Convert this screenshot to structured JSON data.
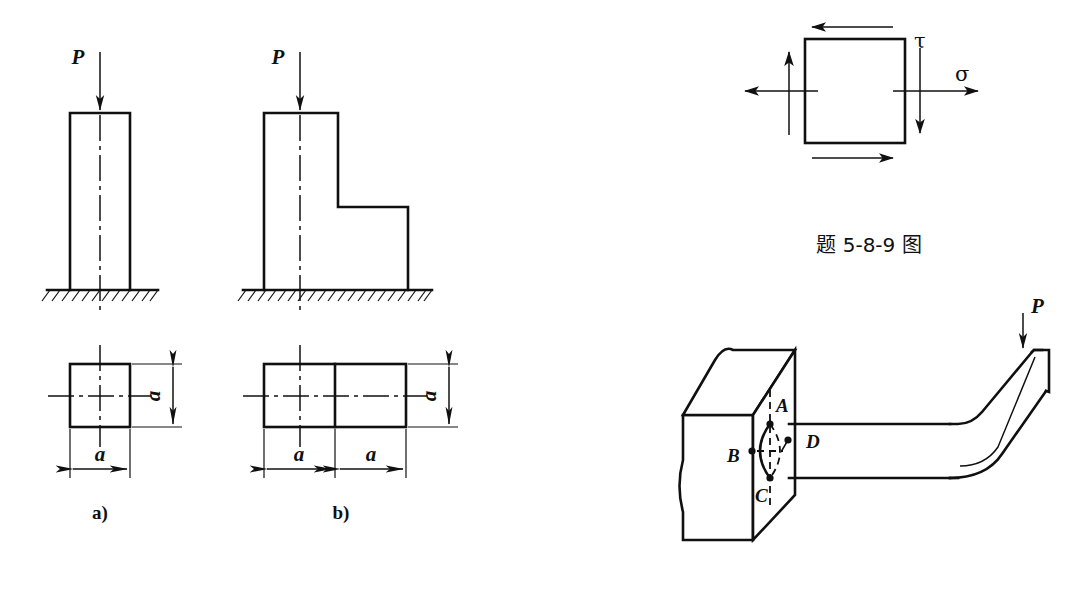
{
  "sheet": {
    "width": 1067,
    "height": 590,
    "background": "#ffffff",
    "ink": "#101010"
  },
  "figure_a": {
    "caption": "a)",
    "load_label": "P",
    "elevation": {
      "description": "square prismatic column on ground",
      "column_left": 70,
      "column_right": 130,
      "column_top": 113,
      "ground_y": 290
    },
    "plan": {
      "description": "square cross-section a by a",
      "left": 70,
      "right": 130,
      "top": 364,
      "bottom": 427,
      "width_label": "a",
      "height_label": "a"
    }
  },
  "figure_b": {
    "caption": "b)",
    "load_label": "P",
    "elevation": {
      "description": "stepped column, upper shaft over wider base",
      "column_left": 264,
      "column_right": 338,
      "column_top": 113,
      "step_y": 207,
      "base_right": 408,
      "ground_y": 290
    },
    "plan": {
      "description": "rectangular cross-section 2a by a split into two a by a squares",
      "left": 264,
      "mid": 335,
      "right": 406,
      "top": 364,
      "bottom": 427,
      "width_label_left": "a",
      "width_label_right": "a",
      "height_label": "a"
    }
  },
  "figure_stress_element": {
    "description": "plane stress element with normal stress sigma and shear stress tau",
    "square": {
      "left": 805,
      "right": 905,
      "top": 39,
      "bottom": 143
    },
    "normal_stress_label": "σ",
    "shear_stress_label": "τ",
    "arrows": [
      {
        "name": "sigma-right",
        "direction": "right"
      },
      {
        "name": "sigma-left",
        "direction": "left"
      },
      {
        "name": "tau-top",
        "direction": "left"
      },
      {
        "name": "tau-bottom",
        "direction": "right"
      },
      {
        "name": "tau-left",
        "direction": "up"
      },
      {
        "name": "tau-right",
        "direction": "down"
      }
    ],
    "caption": "题 5-8-9 图"
  },
  "figure_cantilever": {
    "description": "circular cantilever rod built into a wall, bent up at the free end, loaded by P",
    "load_label": "P",
    "points": [
      {
        "label": "A",
        "position": "top"
      },
      {
        "label": "B",
        "position": "left"
      },
      {
        "label": "C",
        "position": "bottom"
      },
      {
        "label": "D",
        "position": "right"
      }
    ]
  }
}
